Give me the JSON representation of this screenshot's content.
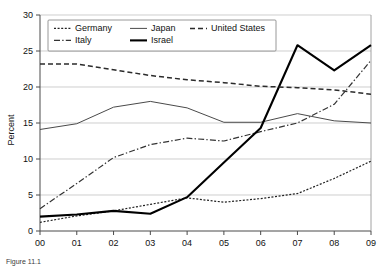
{
  "chart_data": {
    "type": "line",
    "title": "",
    "xlabel": "",
    "ylabel": "Percent",
    "ylim": [
      0,
      30
    ],
    "ytick_step": 5,
    "yticks": [
      "0",
      "5",
      "10",
      "15",
      "20",
      "25",
      "30"
    ],
    "grid": true,
    "legend_position": "top-left-inside",
    "categories": [
      "00",
      "01",
      "02",
      "03",
      "04",
      "05",
      "06",
      "07",
      "08",
      "09"
    ],
    "series": [
      {
        "name": "Germany",
        "style": "dotted",
        "color": "#222222",
        "values": [
          1.2,
          2.1,
          2.8,
          3.7,
          4.6,
          4.0,
          4.5,
          5.2,
          7.3,
          9.7
        ]
      },
      {
        "name": "Italy",
        "style": "dash-dot",
        "color": "#333333",
        "values": [
          3.1,
          6.6,
          10.2,
          12.0,
          12.9,
          12.5,
          13.8,
          15.0,
          17.6,
          23.7
        ]
      },
      {
        "name": "Japan",
        "style": "solid-thin",
        "color": "#4a4a4a",
        "values": [
          14.1,
          14.9,
          17.2,
          18.0,
          17.1,
          15.1,
          15.1,
          16.3,
          15.3,
          15.0
        ]
      },
      {
        "name": "Israel",
        "style": "solid-thick",
        "color": "#000000",
        "values": [
          2.0,
          2.3,
          2.8,
          2.4,
          4.7,
          9.5,
          14.3,
          25.8,
          22.3,
          25.8
        ]
      },
      {
        "name": "United States",
        "style": "dashed",
        "color": "#2b2b2b",
        "values": [
          23.2,
          23.2,
          22.4,
          21.6,
          21.0,
          20.6,
          20.1,
          19.9,
          19.6,
          19.0
        ]
      }
    ],
    "legend_entries": [
      {
        "label": "Germany",
        "style": "dotted"
      },
      {
        "label": "Japan",
        "style": "solid-thin"
      },
      {
        "label": "United States",
        "style": "dashed"
      },
      {
        "label": "Italy",
        "style": "dash-dot"
      },
      {
        "label": "Israel",
        "style": "solid-thick"
      }
    ]
  },
  "caption": {
    "text": "Figure 11.1"
  }
}
